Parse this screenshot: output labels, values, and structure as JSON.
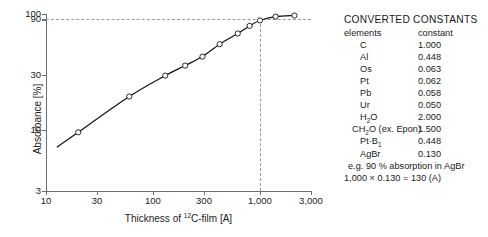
{
  "chart_data": {
    "type": "line",
    "title": "",
    "xlabel": "Thickness of ¹²C-film [A]",
    "xlabel_prefix": "Thickness of ",
    "xlabel_sup": "12",
    "xlabel_suffix": "C-film [A]",
    "ylabel": "Absorbance [%]",
    "xscale": "log",
    "yscale": "log",
    "xlim": [
      10,
      3000
    ],
    "ylim": [
      3,
      100
    ],
    "grid": false,
    "legend": "none",
    "xticks": [
      "10",
      "30",
      "100",
      "300",
      "1,000",
      "3,000"
    ],
    "xtick_values": [
      10,
      30,
      100,
      300,
      1000,
      3000
    ],
    "yticks": [
      "3",
      "10",
      "30",
      "90",
      "100"
    ],
    "ytick_values": [
      3,
      10,
      30,
      90,
      100
    ],
    "x": [
      20,
      60,
      130,
      200,
      290,
      420,
      620,
      800,
      1000,
      1400,
      2100
    ],
    "values": [
      9.6,
      19.5,
      29.5,
      36.0,
      43.0,
      55.0,
      68.0,
      79.0,
      88.0,
      95.0,
      97.0
    ],
    "marker": "open-circle",
    "annotations": [
      {
        "name": "horizontal-guide-90",
        "type": "hline",
        "y": 90,
        "style": "dashed"
      },
      {
        "name": "vertical-guide-1000",
        "type": "vline",
        "x": 1000,
        "style": "dashed"
      }
    ]
  },
  "constants": {
    "title": "CONVERTED  CONSTANTS",
    "col_elements": "elements",
    "col_constant": "constant",
    "rows": [
      {
        "element": "C",
        "value": "1.000"
      },
      {
        "element": "Al",
        "value": "0.448"
      },
      {
        "element": "Os",
        "value": "0.063"
      },
      {
        "element": "Pt",
        "value": "0.062"
      },
      {
        "element": "Pb",
        "value": "0.058"
      },
      {
        "element": "Ur",
        "value": "0.050"
      },
      {
        "element": "H₂O",
        "value": "2.000"
      },
      {
        "element": "CH₂O (ex. Epon)",
        "value": "1.500"
      },
      {
        "element": "Pt·B₁",
        "value": "0.448"
      },
      {
        "element": "AgBr",
        "value": "0.130"
      }
    ],
    "example_line1": "e.g. 90 %  absorption  in  AgBr",
    "example_line2": "1,000 × 0.130 = 130 (A)"
  },
  "colors": {
    "curve": "#111111",
    "axis": "#6e6e6e",
    "guide": "#9a9a9a",
    "text": "#1a1a1a",
    "background": "#ffffff"
  }
}
